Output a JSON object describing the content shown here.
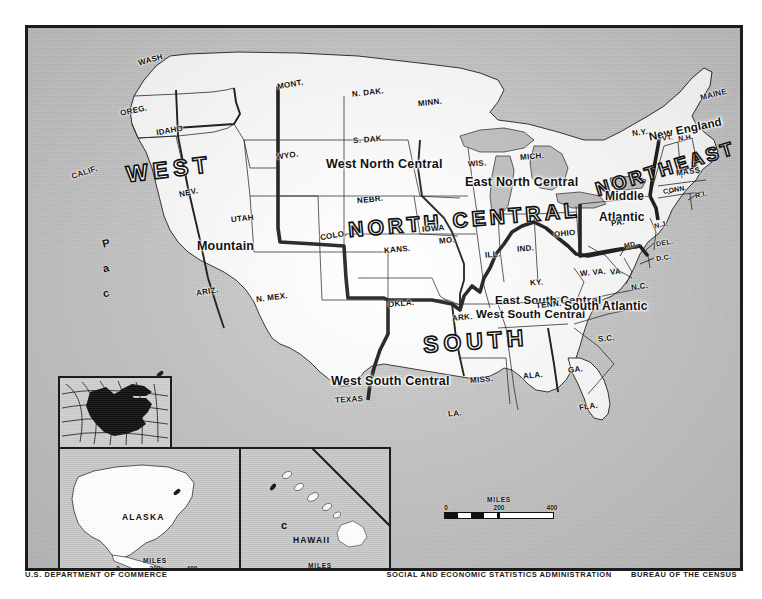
{
  "map": {
    "regions": [
      {
        "id": "west",
        "label": "WEST"
      },
      {
        "id": "north-central",
        "label": "NORTH CENTRAL"
      },
      {
        "id": "south",
        "label": "SOUTH"
      },
      {
        "id": "northeast",
        "label": "NORTHEAST"
      }
    ],
    "divisions": [
      {
        "id": "pacific",
        "label": "Pacific"
      },
      {
        "id": "mountain",
        "label": "Mountain"
      },
      {
        "id": "west-north-central",
        "label": "West North Central"
      },
      {
        "id": "east-north-central",
        "label": "East North Central"
      },
      {
        "id": "west-south-central",
        "label": "West South Central"
      },
      {
        "id": "east-south-central",
        "label": "East South Central"
      },
      {
        "id": "south-atlantic",
        "label": "South Atlantic"
      },
      {
        "id": "middle-atlantic-1",
        "label": "Middle"
      },
      {
        "id": "middle-atlantic-2",
        "label": "Atlantic"
      },
      {
        "id": "new-england",
        "label": "New England"
      }
    ],
    "states": [
      {
        "id": "wash",
        "label": "WASH."
      },
      {
        "id": "oreg",
        "label": "OREG."
      },
      {
        "id": "idaho",
        "label": "IDAHO"
      },
      {
        "id": "mont",
        "label": "MONT."
      },
      {
        "id": "ndak",
        "label": "N. DAK."
      },
      {
        "id": "minn",
        "label": "MINN."
      },
      {
        "id": "sdak",
        "label": "S. DAK."
      },
      {
        "id": "wyo",
        "label": "WYO."
      },
      {
        "id": "calif",
        "label": "CALIF."
      },
      {
        "id": "nev",
        "label": "NEV."
      },
      {
        "id": "utah",
        "label": "UTAH"
      },
      {
        "id": "colo",
        "label": "COLO."
      },
      {
        "id": "nebr",
        "label": "NEBR."
      },
      {
        "id": "iowa",
        "label": "IOWA"
      },
      {
        "id": "wis",
        "label": "WIS."
      },
      {
        "id": "mich",
        "label": "MICH."
      },
      {
        "id": "ariz",
        "label": "ARIZ."
      },
      {
        "id": "nmex",
        "label": "N. MEX."
      },
      {
        "id": "kans",
        "label": "KANS."
      },
      {
        "id": "mo",
        "label": "MO."
      },
      {
        "id": "ill",
        "label": "ILL."
      },
      {
        "id": "ind",
        "label": "IND."
      },
      {
        "id": "ohio",
        "label": "OHIO"
      },
      {
        "id": "ky",
        "label": "KY."
      },
      {
        "id": "okla",
        "label": "OKLA."
      },
      {
        "id": "ark",
        "label": "ARK."
      },
      {
        "id": "tenn",
        "label": "TENN."
      },
      {
        "id": "wva",
        "label": "W. VA."
      },
      {
        "id": "va",
        "label": "VA."
      },
      {
        "id": "nc",
        "label": "N.C."
      },
      {
        "id": "sc",
        "label": "S.C."
      },
      {
        "id": "ga",
        "label": "GA."
      },
      {
        "id": "ala",
        "label": "ALA."
      },
      {
        "id": "miss",
        "label": "MISS."
      },
      {
        "id": "la",
        "label": "LA."
      },
      {
        "id": "texas",
        "label": "TEXAS"
      },
      {
        "id": "fla",
        "label": "FLA."
      },
      {
        "id": "pa",
        "label": "PA."
      },
      {
        "id": "ny",
        "label": "N.Y."
      },
      {
        "id": "vt",
        "label": "VT."
      },
      {
        "id": "nh",
        "label": "N.H."
      },
      {
        "id": "maine",
        "label": "MAINE"
      },
      {
        "id": "mass",
        "label": "MASS."
      },
      {
        "id": "conn",
        "label": "CONN."
      },
      {
        "id": "ri",
        "label": "R.I."
      },
      {
        "id": "nj",
        "label": "N.J."
      },
      {
        "id": "del",
        "label": "DEL."
      },
      {
        "id": "md",
        "label": "MD."
      },
      {
        "id": "dc",
        "label": "D.C."
      }
    ],
    "pacific_vertical": [
      "P",
      "a",
      "c",
      "i",
      "f",
      "i",
      "c"
    ]
  },
  "insets": {
    "globe": {
      "name": "globe-locator-inset"
    },
    "alaska": {
      "label": "ALASKA"
    },
    "hawaii": {
      "label": "HAWAII",
      "marker": "c"
    }
  },
  "scales": {
    "main": {
      "title": "MILES",
      "ticks": [
        "0",
        "200",
        "400"
      ]
    },
    "alaska": {
      "title": "MILES",
      "ticks": [
        "0",
        "200",
        "400"
      ]
    },
    "hawaii": {
      "title": "MILES",
      "ticks": [
        "0",
        "100",
        "200"
      ]
    }
  },
  "credits": {
    "left": "U.S. DEPARTMENT OF COMMERCE",
    "right_agency": "SOCIAL AND ECONOMIC STATISTICS ADMINISTRATION",
    "right_bureau": "BUREAU OF THE CENSUS"
  },
  "colors": {
    "ocean": "#c8c8c8",
    "land": "#ffffff",
    "ink": "#111111",
    "region_border": "#111111"
  }
}
